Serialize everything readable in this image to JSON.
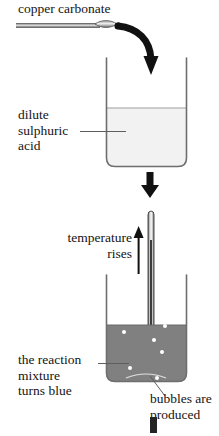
{
  "diagram": {
    "title_text": "copper carbonate",
    "labels": {
      "copper_carbonate": "copper carbonate",
      "dilute_sulphuric_acid_line1": "dilute",
      "dilute_sulphuric_acid_line2": "sulphuric",
      "dilute_sulphuric_acid_line3": "acid",
      "temperature_rises_line1": "temperature",
      "temperature_rises_line2": "rises",
      "reaction_mixture_line1": "the reaction",
      "reaction_mixture_line2": "mixture",
      "reaction_mixture_line3": "turns blue",
      "bubbles_line1": "bubbles are",
      "bubbles_line2": "produced"
    },
    "icons": {
      "spatula": "spatula-icon",
      "curved_arrow": "curved-arrow-icon",
      "down_arrow": "down-arrow-icon",
      "up_arrow": "up-arrow-icon",
      "thermometer": "thermometer-icon",
      "beaker_top": "beaker-icon",
      "beaker_bottom": "beaker-icon"
    },
    "colors": {
      "acid_liquid": "#f2f2f2",
      "reaction_liquid": "#808080",
      "beaker_outline": "#6e6e6e",
      "arrow": "#111111",
      "bubble": "#ffffff",
      "text": "#141414",
      "leader_line": "#5e5e5e",
      "background": "#ffffff"
    },
    "bubbles": [
      {
        "cx": 26,
        "cy": 38
      },
      {
        "cx": 20,
        "cy": 58
      },
      {
        "cx": 26,
        "cy": 94
      },
      {
        "cx": 55,
        "cy": 32
      },
      {
        "cx": 61,
        "cy": 52
      },
      {
        "cx": 50,
        "cy": 66
      },
      {
        "cx": 58,
        "cy": 78
      },
      {
        "cx": 53,
        "cy": 104
      }
    ]
  }
}
